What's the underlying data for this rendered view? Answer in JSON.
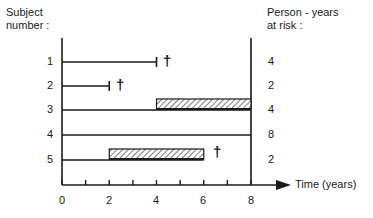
{
  "left_header": {
    "line1": "Subject",
    "line2": "number :"
  },
  "right_header": {
    "line1": "Person - years",
    "line2": "at risk :"
  },
  "x_axis": {
    "label": "Time (years)",
    "ticks": [
      "0",
      "2",
      "4",
      "6",
      "8"
    ],
    "min": 0,
    "max": 8,
    "minor_step": 1
  },
  "subjects": [
    {
      "number": "1",
      "follow_up": [
        0,
        4
      ],
      "exposure": null,
      "died": true,
      "person_years": "4"
    },
    {
      "number": "2",
      "follow_up": [
        0,
        2
      ],
      "exposure": null,
      "died": true,
      "person_years": "2"
    },
    {
      "number": "3",
      "follow_up": [
        0,
        8
      ],
      "exposure": [
        4,
        8
      ],
      "died": false,
      "person_years": "4"
    },
    {
      "number": "4",
      "follow_up": [
        0,
        8
      ],
      "exposure": null,
      "died": false,
      "person_years": "8"
    },
    {
      "number": "5",
      "follow_up": [
        0,
        6
      ],
      "exposure": [
        2,
        6
      ],
      "died": true,
      "person_years": "2"
    }
  ],
  "death_symbol": "†",
  "colors": {
    "ink": "#1a1a1a",
    "hatch": "#333333",
    "background": "#ffffff"
  }
}
